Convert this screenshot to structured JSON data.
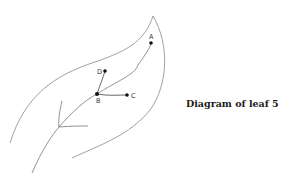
{
  "caption": "Diagram of leaf 5",
  "colors": {
    "outline": "#777777",
    "vein": "#666666",
    "point": "#111111",
    "background": "#ffffff"
  },
  "points": [
    {
      "label": "A",
      "x": 151,
      "y": 43
    },
    {
      "label": "B",
      "x": 97,
      "y": 94
    },
    {
      "label": "C",
      "x": 127,
      "y": 95
    },
    {
      "label": "D",
      "x": 105,
      "y": 71
    }
  ]
}
